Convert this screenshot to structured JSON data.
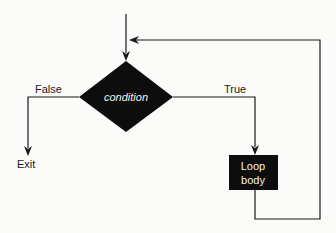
{
  "diagram": {
    "type": "flowchart",
    "colors": {
      "background": "#fbfbf9",
      "line": "#1a1a1a",
      "shape_fill": "#0d0d0d",
      "shape_text": "#f2f2f2"
    },
    "nodes": [
      {
        "id": "condition",
        "shape": "diamond",
        "label": "condition"
      },
      {
        "id": "loop_body",
        "shape": "rectangle",
        "label_line1": "Loop",
        "label_line2": "body"
      },
      {
        "id": "exit",
        "shape": "terminal-text",
        "label": "Exit"
      }
    ],
    "edges": [
      {
        "from": "entry",
        "to": "condition",
        "label": ""
      },
      {
        "from": "condition",
        "to": "exit",
        "label": "False"
      },
      {
        "from": "condition",
        "to": "loop_body",
        "label": "True"
      },
      {
        "from": "loop_body",
        "to": "condition",
        "label": ""
      }
    ],
    "labels": {
      "condition": "condition",
      "loop_line1": "Loop",
      "loop_line2": "body",
      "false_branch": "False",
      "true_branch": "True",
      "exit": "Exit"
    }
  }
}
